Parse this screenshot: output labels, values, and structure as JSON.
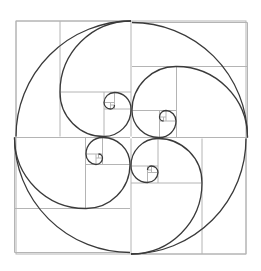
{
  "diagram": {
    "type": "geometric-construction",
    "background_color": "#ffffff",
    "grid_color": "#b4b4b4",
    "curve_color": "#3a3a3a",
    "center": [
      131,
      136.5
    ],
    "outer_square": {
      "x": 16,
      "y": 21,
      "size": 230
    },
    "spiral_count": 4,
    "rotation_step_deg": 90,
    "ratio": 1.618
  }
}
